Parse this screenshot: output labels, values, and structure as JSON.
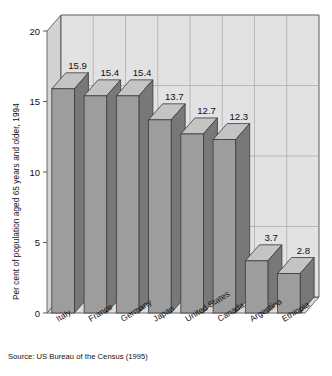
{
  "chart_data": {
    "type": "bar",
    "title": "",
    "subtitle": "",
    "xlabel": "",
    "ylabel": "Per cent of population aged 65 years and older, 1994",
    "ylim": [
      0,
      20
    ],
    "yticks": [
      0,
      5,
      10,
      15,
      20
    ],
    "ytick_labels": [
      "0",
      "5",
      "10",
      "15",
      "20"
    ],
    "grid": true,
    "legend": "none",
    "style": "3d-column",
    "categories": [
      "Italy",
      "France",
      "Germany",
      "Japan",
      "United States",
      "Canada",
      "Argentina",
      "Ethiopia"
    ],
    "values": [
      15.9,
      15.4,
      15.4,
      13.7,
      12.7,
      12.3,
      3.7,
      2.8
    ],
    "value_labels": [
      "15.9",
      "15.4",
      "15.4",
      "13.7",
      "12.7",
      "12.3",
      "3.7",
      "2.8"
    ],
    "annotations": []
  },
  "figure": {
    "source_note": "Source: US Bureau of the Census (1995)"
  },
  "colors": {
    "bar_front": "#9d9d9d",
    "bar_top": "#c4c4c4",
    "bar_side": "#787878",
    "bar_outline": "#3a3a3a",
    "wall_back": "#e2e2e2",
    "wall_left": "#d2d2d2",
    "floor": "#dcdcdc",
    "grid": "#a8a8a8",
    "axis": "#4a4a4a",
    "text": "#111111",
    "page_background": "#ffffff"
  }
}
